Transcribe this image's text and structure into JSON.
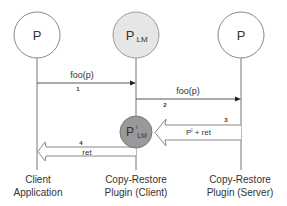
{
  "diagram": {
    "type": "sequence",
    "participants": [
      {
        "id": "client",
        "symbol": "P",
        "sub": "",
        "sup": "",
        "fill": "#ffffff",
        "label_line1": "Client",
        "label_line2": "Application"
      },
      {
        "id": "plugin-client",
        "symbol": "P",
        "sub": "LM",
        "sup": "",
        "fill": "#e6e6e6",
        "label_line1": "Copy-Restore",
        "label_line2": "Plugin (Client)"
      },
      {
        "id": "plugin-server",
        "symbol": "P",
        "sub": "",
        "sup": "",
        "fill": "#ffffff",
        "label_line1": "Copy-Restore",
        "label_line2": "Plugin (Server)"
      }
    ],
    "inner_node": {
      "symbol": "P",
      "sup": "l",
      "sub": "LM",
      "fill": "#999999"
    },
    "messages": [
      {
        "step": "1",
        "label": "foo(p)",
        "from": "client",
        "to": "plugin-client",
        "style": "thin"
      },
      {
        "step": "2",
        "label": "foo(p)",
        "from": "plugin-client",
        "to": "plugin-server",
        "style": "thin"
      },
      {
        "step": "3",
        "label": "P",
        "label_sup": "l",
        "label_rest": " + ret",
        "from": "plugin-server",
        "to": "plugin-client",
        "style": "block"
      },
      {
        "step": "4",
        "label": "ret",
        "from": "plugin-client",
        "to": "client",
        "style": "block"
      }
    ]
  }
}
